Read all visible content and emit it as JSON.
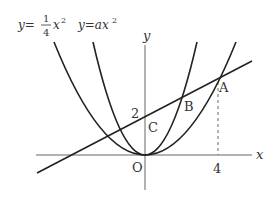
{
  "diagram": {
    "type": "coordinate-graph",
    "curves": [
      {
        "id": "curve1",
        "equation": "y = (1/4)x^2",
        "label_lhs": "y=",
        "label_num": "1",
        "label_den": "4",
        "label_var": "x",
        "label_exp": "2"
      },
      {
        "id": "curve2",
        "equation": "y = ax^2",
        "label": "y=ax",
        "label_exp": "2"
      }
    ],
    "line": {
      "passes_through": [
        "C",
        "B",
        "A"
      ]
    },
    "axes": {
      "x_label": "x",
      "y_label": "y"
    },
    "points": {
      "origin": "O",
      "A": "A",
      "B": "B",
      "C": "C"
    },
    "ticks": {
      "y_intercept": "2",
      "x_value": "4"
    },
    "colors": {
      "stroke": "#222222",
      "axis": "#555555",
      "text": "#333333"
    }
  }
}
